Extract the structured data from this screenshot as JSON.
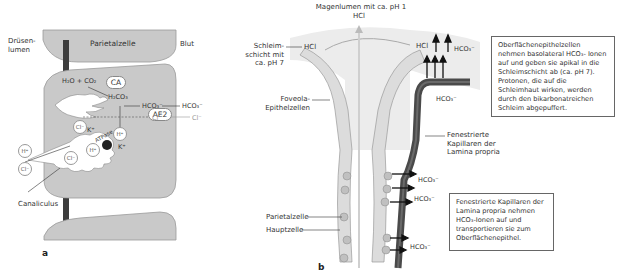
{
  "panel_a": {
    "letter": "a",
    "labels": {
      "druesenlumen": "Drüsen-\nlumen",
      "parietalzelle": "Parietalzelle",
      "blut": "Blut",
      "canaliculus": "Canaliculus"
    },
    "reactions": {
      "reactants": "H₂O + CO₂",
      "enzyme": "CA",
      "carbonic_acid": "H₂CO₃",
      "bicarbonate_in": "HCO₃⁻",
      "bicarbonate_out": "HCO₃⁻",
      "exchanger": "AE2",
      "cl_in": "Cl⁻",
      "cl_out": "Cl⁻"
    },
    "canaliculus_ions": {
      "cl_cell": "Cl⁻",
      "k_plus": "K⁺",
      "h_cell": "H⁺",
      "pump": "ATPase",
      "h_canal": "H⁺",
      "k_in": "K⁺",
      "cl_canal": "Cl⁻",
      "h_lumen": "H⁺",
      "cl_lumen": "Cl⁻"
    }
  },
  "panel_b": {
    "letter": "b",
    "labels": {
      "magenlumen": "Magenlumen mit ca. pH 1",
      "hcl_top": "HCl",
      "schleimschicht": "Schleim-\nschicht mit\nca. pH 7",
      "hcl_left": "HCl",
      "hcl_right": "HCl",
      "hco3_top": "HCO₃⁻",
      "hco3_cap_top": "HCO₃⁻",
      "foveola": "Foveola-\nEpithelzellen",
      "fenestrierte": "Fenestrierte\nKapillaren der\nLamina propria",
      "hco3_1": "HCO₃⁻",
      "hco3_2": "HCO₃⁻",
      "hco3_3": "HCO₃⁻",
      "parietalzelle": "Parietalzelle",
      "hauptzelle": "Hauptzelle"
    },
    "box_top": "Oberflächenepithelzellen nehmen basolateral HCO₃- Ionen auf und geben sie apikal in die Schleimschicht ab (ca. pH 7). Protonen, die auf die Schleimhaut wirken, werden durch den bikarbonatreichen Schleim abgepuffert.",
    "box_bottom": "Fenestrierte Kapillaren der Lamina propria nehmen HCO₃-Ionen auf und transportieren sie zum Oberflächenepithel."
  },
  "colors": {
    "cell_fill": "#c9c9c9",
    "cell_stroke": "#9a9a9a",
    "dark_bar": "#3d3d3d",
    "capillary": "#4a4a4a",
    "mucus": "#e4e4e4"
  }
}
